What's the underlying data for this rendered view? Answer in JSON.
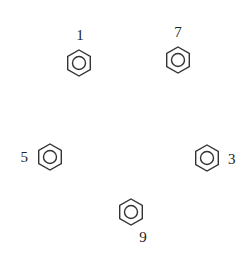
{
  "diagram": {
    "type": "benzene-ring-arrangement",
    "nodes": [
      {
        "label": "1",
        "cx": 79,
        "cy": 63,
        "lx": 80,
        "ly": 40,
        "anchor": "middle"
      },
      {
        "label": "7",
        "cx": 178,
        "cy": 60,
        "lx": 178,
        "ly": 37,
        "anchor": "middle"
      },
      {
        "label": "5",
        "cx": 50,
        "cy": 157,
        "lx": 28,
        "ly": 162,
        "anchor": "end"
      },
      {
        "label": "3",
        "cx": 207,
        "cy": 158,
        "lx": 228,
        "ly": 164,
        "anchor": "start"
      },
      {
        "label": "9",
        "cx": 131,
        "cy": 212,
        "lx": 143,
        "ly": 242,
        "anchor": "middle"
      }
    ],
    "colors": {
      "stroke": "#333333",
      "text": "#222222",
      "background": "#ffffff"
    }
  }
}
